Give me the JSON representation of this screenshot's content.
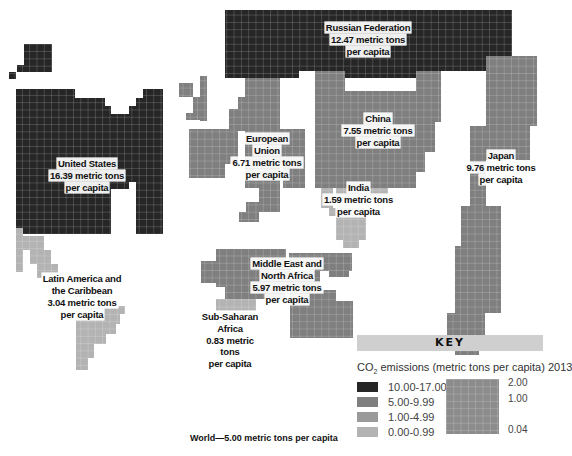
{
  "colors": {
    "dark": "#262626",
    "mid": "#7f7f7f",
    "light": "#9a9a9a",
    "lighter": "#b3b3b3",
    "grid": "#ffffff",
    "key_header_bg": "#cfcfcf"
  },
  "regions": {
    "russia": {
      "name": "Russian Federation",
      "value": "12.47 metric tons",
      "unit": "per capita"
    },
    "us": {
      "name": "United States",
      "value": "16.39 metric tons",
      "unit": "per capita"
    },
    "eu": {
      "name_line1": "European",
      "name_line2": "Union",
      "value": "6.71 metric tons",
      "unit": "per capita"
    },
    "china": {
      "name": "China",
      "value": "7.55 metric tons",
      "unit": "per capita"
    },
    "india": {
      "name": "India",
      "value": "1.59 metric tons",
      "unit": "per capita"
    },
    "japan": {
      "name": "Japan",
      "value": "9.76 metric tons",
      "unit": "per capita"
    },
    "latam": {
      "name_line1": "Latin America and",
      "name_line2": "the Caribbean",
      "value": "3.04 metric tons",
      "unit": "per capita"
    },
    "mena": {
      "name_line1": "Middle East and",
      "name_line2": "North Africa",
      "value": "5.97 metric tons",
      "unit": "per capita"
    },
    "ssa": {
      "name_line1": "Sub-Saharan",
      "name_line2": "Africa",
      "value": "0.83 metric tons",
      "unit": "per capita"
    }
  },
  "key": {
    "header": "KEY",
    "title_prefix": "CO",
    "title_sub": "2",
    "title_suffix": " emissions (metric tons per capita) 2013",
    "ranges": [
      {
        "label": "10.00-17.00",
        "color": "#262626"
      },
      {
        "label": "5.00-9.99",
        "color": "#7f7f7f"
      },
      {
        "label": "1.00-4.99",
        "color": "#9a9a9a"
      },
      {
        "label": "0.00-0.99",
        "color": "#b3b3b3"
      }
    ],
    "scale_labels": [
      "2.00",
      "1.00",
      "0.04"
    ]
  },
  "world": "World—5.00 metric tons per capita",
  "chart_data": {
    "type": "cartogram",
    "title": "CO2 emissions (metric tons per capita) 2013",
    "categories": [
      "United States",
      "Russian Federation",
      "Japan",
      "China",
      "European Union",
      "Middle East and North Africa",
      "Latin America and the Caribbean",
      "India",
      "Sub-Saharan Africa",
      "World"
    ],
    "values": [
      16.39,
      12.47,
      9.76,
      7.55,
      6.71,
      5.97,
      3.04,
      1.59,
      0.83,
      5.0
    ],
    "unit": "metric tons per capita",
    "legend": [
      {
        "range": "10.00-17.00",
        "color": "#262626"
      },
      {
        "range": "5.00-9.99",
        "color": "#7f7f7f"
      },
      {
        "range": "1.00-4.99",
        "color": "#9a9a9a"
      },
      {
        "range": "0.00-0.99",
        "color": "#b3b3b3"
      }
    ],
    "scale_labels": [
      "2.00",
      "1.00",
      "0.04"
    ],
    "annotation": "World—5.00 metric tons per capita"
  },
  "shapes": [
    {
      "id": "us-alaska",
      "color": "dark",
      "rects": [
        [
          24,
          44,
          28,
          28
        ],
        [
          17,
          65,
          7,
          7
        ],
        [
          9,
          72,
          7,
          7
        ]
      ]
    },
    {
      "id": "us",
      "color": "dark",
      "rects": [
        [
          16,
          89,
          59,
          145
        ],
        [
          75,
          98,
          30,
          136
        ],
        [
          105,
          106,
          6,
          128
        ],
        [
          111,
          114,
          18,
          68
        ],
        [
          129,
          106,
          7,
          76
        ],
        [
          136,
          98,
          7,
          98
        ],
        [
          143,
          89,
          20,
          145
        ],
        [
          75,
          182,
          7,
          22
        ],
        [
          82,
          182,
          14,
          22
        ],
        [
          136,
          182,
          27,
          52
        ],
        [
          82,
          204,
          14,
          22
        ],
        [
          105,
          182,
          6,
          14
        ],
        [
          111,
          182,
          18,
          7
        ]
      ]
    },
    {
      "id": "russia",
      "color": "dark",
      "rects": [
        [
          225,
          10,
          287,
          61
        ],
        [
          225,
          71,
          74,
          7
        ],
        [
          344,
          71,
          97,
          7
        ]
      ]
    },
    {
      "id": "greenland-eu",
      "color": "mid",
      "rects": [
        [
          179,
          83,
          14,
          14
        ],
        [
          200,
          76,
          7,
          45
        ],
        [
          193,
          97,
          14,
          16
        ],
        [
          186,
          113,
          14,
          7
        ]
      ]
    },
    {
      "id": "eu",
      "color": "mid",
      "rects": [
        [
          245,
          78,
          35,
          110
        ],
        [
          238,
          97,
          7,
          34
        ],
        [
          229,
          109,
          9,
          55
        ],
        [
          189,
          129,
          49,
          35
        ],
        [
          189,
          164,
          36,
          14
        ],
        [
          280,
          129,
          25,
          35
        ],
        [
          283,
          164,
          22,
          24
        ],
        [
          259,
          188,
          21,
          24
        ],
        [
          246,
          202,
          13,
          10
        ],
        [
          239,
          212,
          20,
          10
        ]
      ]
    },
    {
      "id": "china",
      "color": "mid",
      "rects": [
        [
          315,
          71,
          30,
          26
        ],
        [
          345,
          91,
          71,
          97
        ],
        [
          315,
          97,
          30,
          91
        ],
        [
          416,
          71,
          25,
          51
        ],
        [
          416,
          122,
          19,
          30
        ],
        [
          416,
          152,
          9,
          20
        ]
      ]
    },
    {
      "id": "india",
      "color": "lighter",
      "rects": [
        [
          321,
          188,
          12,
          20
        ],
        [
          329,
          208,
          36,
          8
        ],
        [
          336,
          188,
          52,
          10
        ],
        [
          336,
          216,
          30,
          24
        ],
        [
          343,
          240,
          16,
          8
        ]
      ]
    },
    {
      "id": "japan",
      "color": "mid",
      "rects": [
        [
          486,
          56,
          51,
          70
        ],
        [
          486,
          126,
          44,
          34
        ],
        [
          470,
          126,
          16,
          80
        ],
        [
          461,
          206,
          40,
          40
        ],
        [
          455,
          246,
          46,
          67
        ],
        [
          447,
          313,
          38,
          28
        ],
        [
          455,
          341,
          24,
          14
        ]
      ]
    },
    {
      "id": "latam",
      "color": "lighter",
      "rects": [
        [
          16,
          228,
          7,
          44
        ],
        [
          23,
          236,
          21,
          14
        ],
        [
          30,
          250,
          21,
          14
        ],
        [
          37,
          264,
          21,
          14
        ],
        [
          103,
          290,
          8,
          8
        ],
        [
          76,
          296,
          35,
          10
        ],
        [
          76,
          306,
          49,
          8
        ],
        [
          76,
          314,
          44,
          10
        ],
        [
          76,
          324,
          40,
          10
        ],
        [
          76,
          334,
          30,
          10
        ],
        [
          76,
          344,
          18,
          14
        ],
        [
          76,
          358,
          12,
          12
        ]
      ]
    },
    {
      "id": "mena",
      "color": "mid",
      "rects": [
        [
          216,
          249,
          70,
          18
        ],
        [
          201,
          261,
          15,
          22
        ],
        [
          216,
          267,
          75,
          20
        ],
        [
          225,
          287,
          60,
          12
        ],
        [
          289,
          253,
          21,
          8
        ],
        [
          290,
          253,
          62,
          12
        ],
        [
          310,
          263,
          42,
          8
        ],
        [
          329,
          265,
          20,
          12
        ],
        [
          290,
          271,
          30,
          19
        ],
        [
          290,
          290,
          46,
          48
        ],
        [
          336,
          301,
          17,
          37
        ]
      ]
    },
    {
      "id": "ssa",
      "color": "lighter",
      "rects": [
        [
          216,
          299,
          40,
          14
        ],
        [
          216,
          313,
          26,
          12
        ],
        [
          228,
          325,
          8,
          8
        ],
        [
          232,
          318,
          10,
          8
        ]
      ]
    }
  ]
}
